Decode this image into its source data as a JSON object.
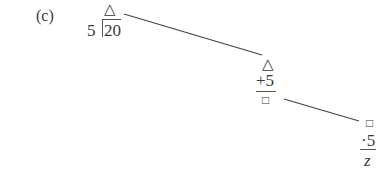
{
  "problem": {
    "label": "(c)",
    "step1": {
      "outside": "5",
      "top_symbol": "△",
      "inside": "20"
    },
    "step2": {
      "top_symbol": "△",
      "operation": "+5",
      "result_symbol": "□"
    },
    "step3": {
      "top_symbol": "□",
      "operation": "·5",
      "result": "z"
    }
  }
}
